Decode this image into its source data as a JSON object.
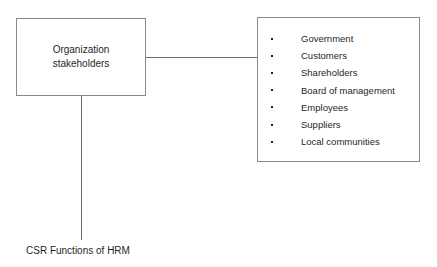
{
  "diagram": {
    "background_color": "#ffffff",
    "line_color": "#8a8a8a",
    "text_color": "#1f1f1f",
    "nodes": {
      "organization": {
        "label": "Organization\nstakeholders",
        "line1": "Organization",
        "line2": "stakeholders"
      },
      "stakeholders": {
        "items": [
          {
            "label": "Government"
          },
          {
            "label": "Customers"
          },
          {
            "label": "Shareholders"
          },
          {
            "label": "Board of management"
          },
          {
            "label": "Employees"
          },
          {
            "label": "Suppliers"
          },
          {
            "label": "Local communities"
          }
        ]
      }
    },
    "caption": "CSR Functions of HRM"
  }
}
